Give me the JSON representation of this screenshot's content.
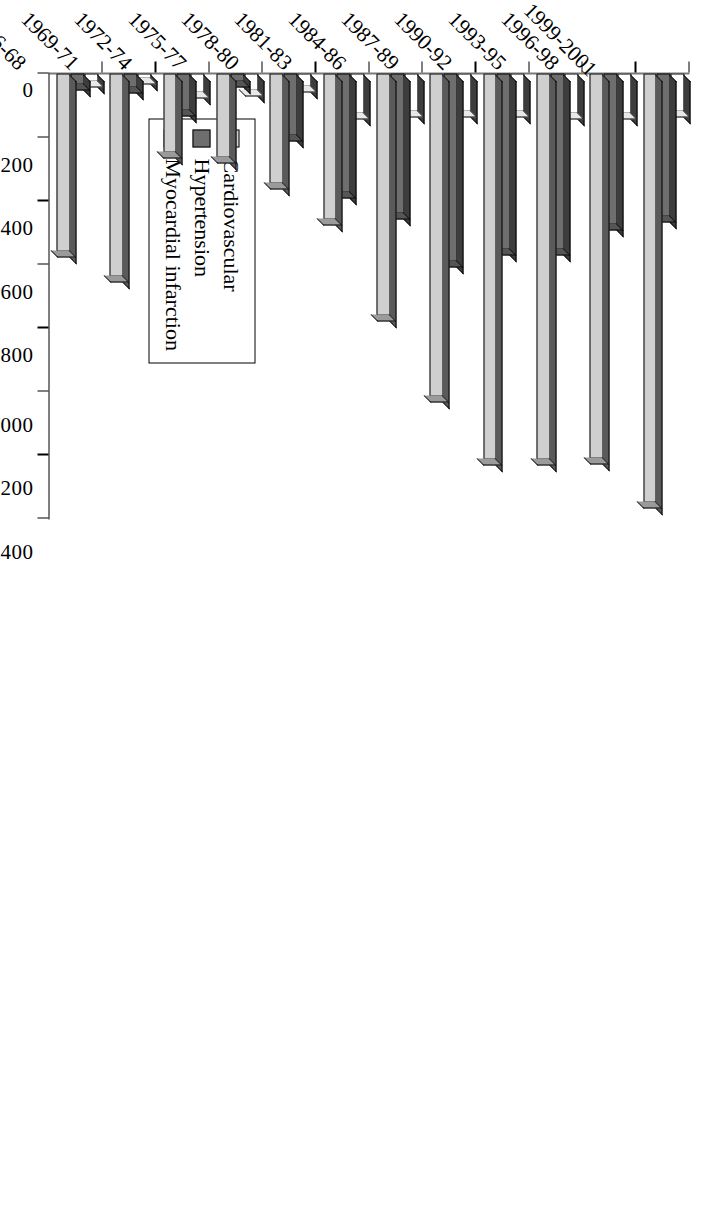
{
  "chart_data": {
    "type": "bar",
    "orientation": "horizontal",
    "title": "",
    "xlabel": "",
    "ylabel": "",
    "xlim": [
      0,
      1400
    ],
    "grid": false,
    "legend_position": "bottom-left",
    "tick_labels": [
      "0",
      "200",
      "400",
      "600",
      "800",
      "1000",
      "1200",
      "1400"
    ],
    "ticks": [
      0,
      200,
      400,
      600,
      800,
      1000,
      1200,
      1400
    ],
    "categories": [
      "1966-68",
      "1969-71",
      "1972-74",
      "1975-77",
      "1978-80",
      "1981-83",
      "1984-86",
      "1987-89",
      "1990-92",
      "1993-95",
      "1996-98",
      "1999-2001"
    ],
    "series": [
      {
        "name": "Cardiovascular",
        "color": "#cfcfcf",
        "values": [
          560,
          640,
          250,
          265,
          345,
          460,
          760,
          1015,
          1215,
          1215,
          1210,
          1350
        ]
      },
      {
        "name": "Hypertension",
        "color": "#6e6e6e",
        "values": [
          35,
          45,
          115,
          25,
          195,
          375,
          440,
          590,
          555,
          555,
          475,
          450
        ]
      },
      {
        "name": "Myocardial infarction",
        "color": "#ffffff",
        "values": [
          25,
          15,
          60,
          55,
          40,
          125,
          120,
          120,
          120,
          125,
          125,
          120
        ]
      }
    ]
  },
  "legend": {
    "items": [
      {
        "label": "Cardiovascular",
        "swatch": "light-gray"
      },
      {
        "label": "Hypertension",
        "swatch": "dark-gray"
      },
      {
        "label": "Myocardial infarction",
        "swatch": "white"
      }
    ]
  }
}
